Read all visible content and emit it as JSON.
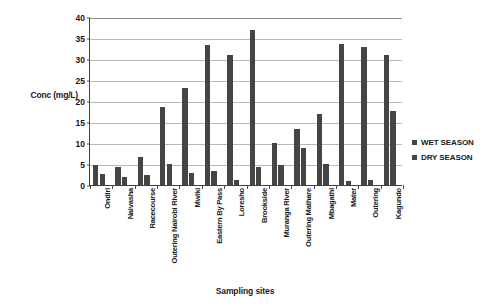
{
  "chart_data": {
    "type": "bar",
    "title": "",
    "xlabel": "Sampling sites",
    "ylabel": "Conc (mg/L)",
    "ylim": [
      0,
      40
    ],
    "ytick_values": [
      0,
      5,
      10,
      15,
      20,
      25,
      30,
      35,
      40
    ],
    "ytick_labels": [
      "0",
      "5",
      "10",
      "15",
      "20",
      "25",
      "30",
      "35",
      "40"
    ],
    "grid": true,
    "legend_position": "right",
    "bar_color": "#454545",
    "categories": [
      "Ondiri",
      "Naivasha",
      "Racecourse",
      "Outering Nairobi River",
      "Mwiki",
      "Eastern By Pass",
      "Loresho",
      "Brookside",
      "Muranga River",
      "Outering Mathare",
      "Mbagathi",
      "Mater",
      "Outering",
      "Kagundo"
    ],
    "series": [
      {
        "name": "WET SEASON",
        "color": "#454545",
        "values": [
          4.8,
          4.3,
          6.7,
          18.5,
          23.1,
          33.3,
          30.9,
          36.9,
          10.1,
          13.3,
          17.0,
          33.6,
          32.8,
          31.0
        ]
      },
      {
        "name": "DRY SEASON",
        "color": "#454545",
        "values": [
          2.7,
          1.9,
          2.4,
          4.9,
          2.8,
          3.4,
          1.3,
          4.2,
          4.8,
          8.9,
          4.9,
          0.9,
          1.2,
          17.7
        ]
      }
    ]
  },
  "legend": {
    "items": [
      {
        "label": "WET SEASON"
      },
      {
        "label": "DRY SEASON"
      }
    ]
  }
}
